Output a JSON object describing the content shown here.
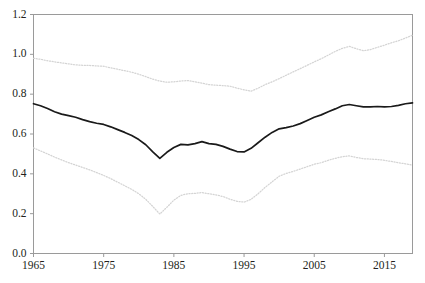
{
  "chart_data": {
    "type": "line",
    "title": "",
    "subtitle": "",
    "xlabel": "",
    "ylabel": "",
    "xlim": [
      1965,
      2019
    ],
    "ylim": [
      0.0,
      1.2
    ],
    "grid": false,
    "legend_position": "none",
    "x_tick_labels": [
      "1965",
      "1975",
      "1985",
      "1995",
      "2005",
      "2015"
    ],
    "x_ticks": [
      1965,
      1975,
      1985,
      1995,
      2005,
      2015
    ],
    "y_tick_labels": [
      "0.0",
      "0.2",
      "0.4",
      "0.6",
      "0.8",
      "1.0",
      "1.2"
    ],
    "y_ticks": [
      0.0,
      0.2,
      0.4,
      0.6,
      0.8,
      1.0,
      1.2
    ],
    "x": [
      1965,
      1966,
      1967,
      1968,
      1969,
      1970,
      1971,
      1972,
      1973,
      1974,
      1975,
      1976,
      1977,
      1978,
      1979,
      1980,
      1981,
      1982,
      1983,
      1984,
      1985,
      1986,
      1987,
      1988,
      1989,
      1990,
      1991,
      1992,
      1993,
      1994,
      1995,
      1996,
      1997,
      1998,
      1999,
      2000,
      2001,
      2002,
      2003,
      2004,
      2005,
      2006,
      2007,
      2008,
      2009,
      2010,
      2011,
      2012,
      2013,
      2014,
      2015,
      2016,
      2017,
      2018,
      2019
    ],
    "series": [
      {
        "name": "upper-bound",
        "style": "dotted",
        "color": "#d4d4d4",
        "values": [
          0.98,
          0.975,
          0.968,
          0.962,
          0.957,
          0.952,
          0.947,
          0.945,
          0.944,
          0.942,
          0.94,
          0.932,
          0.925,
          0.918,
          0.91,
          0.9,
          0.888,
          0.875,
          0.866,
          0.86,
          0.862,
          0.866,
          0.868,
          0.862,
          0.855,
          0.848,
          0.845,
          0.843,
          0.84,
          0.83,
          0.822,
          0.815,
          0.83,
          0.848,
          0.862,
          0.878,
          0.895,
          0.912,
          0.928,
          0.945,
          0.962,
          0.978,
          0.996,
          1.015,
          1.03,
          1.04,
          1.028,
          1.018,
          1.024,
          1.035,
          1.046,
          1.058,
          1.068,
          1.082,
          1.096
        ]
      },
      {
        "name": "central-estimate",
        "style": "solid",
        "color": "#1a1a1a",
        "values": [
          0.752,
          0.742,
          0.728,
          0.712,
          0.7,
          0.692,
          0.684,
          0.672,
          0.662,
          0.654,
          0.648,
          0.636,
          0.622,
          0.608,
          0.592,
          0.572,
          0.546,
          0.51,
          0.478,
          0.508,
          0.532,
          0.548,
          0.545,
          0.552,
          0.562,
          0.552,
          0.548,
          0.538,
          0.524,
          0.512,
          0.51,
          0.528,
          0.556,
          0.584,
          0.608,
          0.626,
          0.632,
          0.64,
          0.652,
          0.668,
          0.684,
          0.696,
          0.712,
          0.726,
          0.742,
          0.748,
          0.742,
          0.736,
          0.736,
          0.738,
          0.736,
          0.738,
          0.744,
          0.752,
          0.756
        ]
      },
      {
        "name": "lower-bound",
        "style": "dotted",
        "color": "#d4d4d4",
        "values": [
          0.53,
          0.515,
          0.5,
          0.484,
          0.47,
          0.456,
          0.444,
          0.432,
          0.42,
          0.406,
          0.392,
          0.376,
          0.358,
          0.34,
          0.322,
          0.3,
          0.272,
          0.236,
          0.198,
          0.232,
          0.268,
          0.292,
          0.3,
          0.302,
          0.306,
          0.3,
          0.294,
          0.286,
          0.272,
          0.262,
          0.258,
          0.272,
          0.3,
          0.332,
          0.36,
          0.388,
          0.402,
          0.412,
          0.424,
          0.436,
          0.448,
          0.456,
          0.468,
          0.478,
          0.486,
          0.49,
          0.482,
          0.476,
          0.474,
          0.472,
          0.468,
          0.462,
          0.456,
          0.45,
          0.444
        ]
      }
    ]
  },
  "axes": {
    "frame_color": "#9a9a9a",
    "tick_color": "#9a9a9a",
    "label_color": "#231f20"
  }
}
